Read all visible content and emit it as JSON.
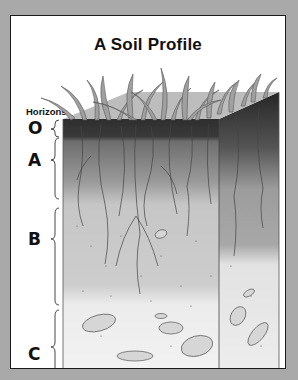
{
  "title": "A Soil Profile",
  "axis_label": "Horizons",
  "horizons": [
    {
      "letter": "O",
      "top": 103,
      "bottom": 121,
      "fill": "#3a3a3a"
    },
    {
      "letter": "A",
      "top": 121,
      "bottom": 190,
      "fill": "#8c8c8c"
    },
    {
      "letter": "B",
      "top": 190,
      "bottom": 292,
      "fill": "#c9c9c9"
    },
    {
      "letter": "C",
      "top": 292,
      "bottom": 354,
      "fill": "#eaeaea"
    }
  ],
  "colors": {
    "background": "#a9a9a9",
    "panel": "#ffffff",
    "border": "#1a1a1a",
    "grass": "#9a9a9a"
  }
}
